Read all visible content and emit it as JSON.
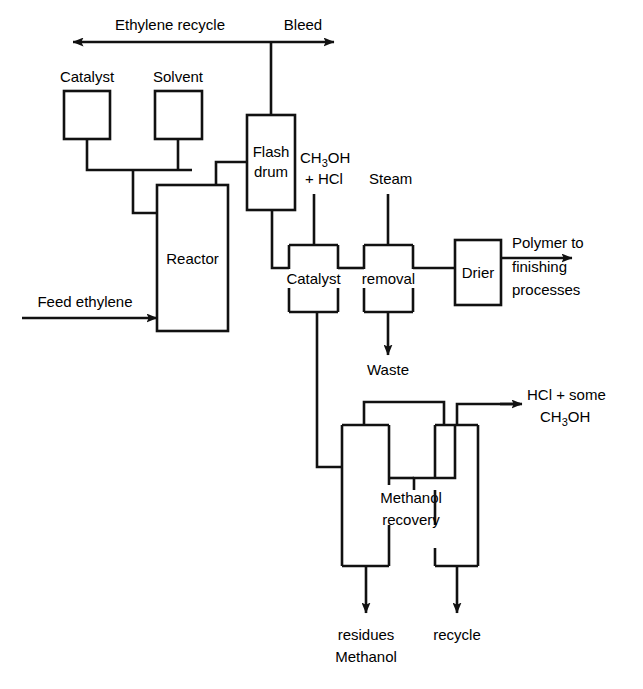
{
  "diagram": {
    "background_color": "#ffffff",
    "line_color": "#111111",
    "text_color": "#000000",
    "width": 643,
    "height": 689,
    "units": [
      {
        "id": "catalyst",
        "label": "Catalyst",
        "label_position": "above",
        "x": 64,
        "y": 91,
        "w": 46,
        "h": 48
      },
      {
        "id": "solvent",
        "label": "Solvent",
        "label_position": "above",
        "x": 155,
        "y": 91,
        "w": 47,
        "h": 48
      },
      {
        "id": "reactor",
        "label": "Reactor",
        "label_position": "inside",
        "x": 157,
        "y": 185,
        "w": 71,
        "h": 146
      },
      {
        "id": "flash-drum",
        "label": "Flash drum",
        "label_line_1": "Flash",
        "label_line_2": "drum",
        "label_position": "inside",
        "x": 247,
        "y": 115,
        "w": 48,
        "h": 95
      },
      {
        "id": "catalyst-removal-vessel-1",
        "label": "Catalyst",
        "label_position": "crossing",
        "x": 289,
        "y": 245,
        "w": 49,
        "h": 67
      },
      {
        "id": "catalyst-removal-vessel-2",
        "label": "removal",
        "label_position": "crossing",
        "x": 364,
        "y": 245,
        "w": 49,
        "h": 67
      },
      {
        "id": "drier",
        "label": "Drier",
        "label_position": "inside",
        "x": 455,
        "y": 240,
        "w": 46,
        "h": 65
      },
      {
        "id": "methanol-recovery-column-1",
        "label": "Methanol",
        "label_position": "crossing",
        "x": 342,
        "y": 425,
        "w": 47,
        "h": 141
      },
      {
        "id": "methanol-recovery-column-2",
        "label": "recovery",
        "label_position": "crossing",
        "x": 435,
        "y": 425,
        "w": 43,
        "h": 141
      }
    ],
    "stream_labels": [
      {
        "id": "ethylene-recycle",
        "text": "Ethylene recycle",
        "x": 170,
        "y": 30,
        "anchor": "middle"
      },
      {
        "id": "bleed",
        "text": "Bleed",
        "x": 303,
        "y": 30,
        "anchor": "middle"
      },
      {
        "id": "feed-ethylene",
        "text": "Feed ethylene",
        "x": 85,
        "y": 307,
        "anchor": "middle"
      },
      {
        "id": "methanol-hcl-feed-line-1",
        "text": "CH3OH",
        "x": 300,
        "y": 163,
        "anchor": "start"
      },
      {
        "id": "methanol-hcl-feed-line-2",
        "text": "+ HCl",
        "x": 305,
        "y": 184,
        "anchor": "start"
      },
      {
        "id": "steam",
        "text": "Steam",
        "x": 369,
        "y": 184,
        "anchor": "start"
      },
      {
        "id": "polymer-to-finishing-line-1",
        "text": "Polymer to",
        "x": 512,
        "y": 248,
        "anchor": "start"
      },
      {
        "id": "polymer-to-finishing-line-2",
        "text": "finishing",
        "x": 512,
        "y": 272,
        "anchor": "start"
      },
      {
        "id": "polymer-to-finishing-line-3",
        "text": "processes",
        "x": 512,
        "y": 295,
        "anchor": "start"
      },
      {
        "id": "waste",
        "text": "Waste",
        "x": 388,
        "y": 375,
        "anchor": "middle"
      },
      {
        "id": "hcl-plus-some-line-1",
        "text": "HCl + some",
        "x": 527,
        "y": 400,
        "anchor": "start"
      },
      {
        "id": "hcl-plus-some-line-2",
        "text": "CH3OH",
        "x": 540,
        "y": 422,
        "anchor": "start"
      },
      {
        "id": "catalyst-residues-line-1",
        "text": "Catalyst",
        "x": 366,
        "y": 640,
        "anchor": "middle"
      },
      {
        "id": "catalyst-residues-line-2",
        "text": "residues",
        "x": 366,
        "y": 662,
        "anchor": "middle"
      },
      {
        "id": "methanol-recycle-line-1",
        "text": "Methanol",
        "x": 457,
        "y": 640,
        "anchor": "middle"
      },
      {
        "id": "methanol-recycle-line-2",
        "text": "recycle",
        "x": 457,
        "y": 662,
        "anchor": "middle"
      }
    ],
    "unit_text": {
      "reactor": "Reactor",
      "flash_drum_1": "Flash",
      "flash_drum_2": "drum",
      "catalyst_removal_1": "Catalyst",
      "catalyst_removal_2": "removal",
      "drier": "Drier",
      "methanol_recovery_1": "Methanol",
      "methanol_recovery_2": "recovery",
      "catalyst_tank": "Catalyst",
      "solvent_tank": "Solvent"
    },
    "formula_parts": {
      "ch3oh_c": "CH",
      "ch3oh_3": "3",
      "ch3oh_oh": "OH",
      "plus_hcl": "+ HCl",
      "hcl_some": "HCl + some"
    },
    "streams": [
      {
        "id": "recycle-bleed-header",
        "from": "flash-drum-top",
        "to": "recycle-and-bleed",
        "arrow_ends": "both"
      },
      {
        "id": "catalyst-to-reactor",
        "from": "catalyst",
        "to": "reactor",
        "arrow_ends": "none"
      },
      {
        "id": "solvent-to-reactor",
        "from": "solvent",
        "to": "reactor",
        "arrow_ends": "none"
      },
      {
        "id": "feed-ethylene-to-reactor",
        "from": "feed",
        "to": "reactor",
        "arrow_ends": "head"
      },
      {
        "id": "reactor-to-flash-drum",
        "from": "reactor",
        "to": "flash-drum",
        "arrow_ends": "none"
      },
      {
        "id": "flash-drum-to-catalyst-removal",
        "from": "flash-drum",
        "to": "catalyst-removal-vessel-1",
        "arrow_ends": "none"
      },
      {
        "id": "methanol-hcl-to-catalyst-removal",
        "from": "ch3oh-hcl",
        "to": "catalyst-removal-vessel-1",
        "arrow_ends": "none"
      },
      {
        "id": "steam-to-removal",
        "from": "steam",
        "to": "catalyst-removal-vessel-2",
        "arrow_ends": "none"
      },
      {
        "id": "removal-to-drier",
        "from": "catalyst-removal-vessel-2",
        "to": "drier",
        "arrow_ends": "none"
      },
      {
        "id": "drier-to-polymer",
        "from": "drier",
        "to": "finishing",
        "arrow_ends": "head"
      },
      {
        "id": "removal-to-waste",
        "from": "catalyst-removal-vessel-2",
        "to": "waste",
        "arrow_ends": "head"
      },
      {
        "id": "catalyst-removal-to-methanol-recovery",
        "from": "catalyst-removal-vessel-1",
        "to": "methanol-recovery-column-1",
        "arrow_ends": "none"
      },
      {
        "id": "column1-top-to-column2",
        "from": "methanol-recovery-column-1",
        "to": "methanol-recovery-column-2",
        "arrow_ends": "none"
      },
      {
        "id": "column2-to-column1-side",
        "from": "methanol-recovery-column-2",
        "to": "methanol-recovery-column-1",
        "arrow_ends": "none"
      },
      {
        "id": "column2-top-to-hcl",
        "from": "methanol-recovery-column-2",
        "to": "hcl-some-methanol",
        "arrow_ends": "head"
      },
      {
        "id": "column1-bottom-to-catalyst-residues",
        "from": "methanol-recovery-column-1",
        "to": "catalyst-residues",
        "arrow_ends": "head"
      },
      {
        "id": "column2-bottom-to-methanol-recycle",
        "from": "methanol-recovery-column-2",
        "to": "methanol-recycle",
        "arrow_ends": "head"
      }
    ]
  }
}
